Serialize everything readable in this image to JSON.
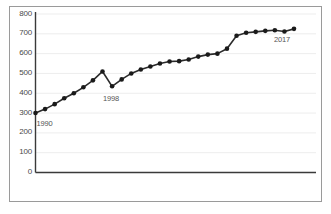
{
  "chart_data": {
    "type": "line",
    "title": "",
    "subtitle": "",
    "xlabel": "",
    "ylabel": "",
    "ylim": [
      0,
      800
    ],
    "xlim": [
      1990,
      2017
    ],
    "grid": true,
    "grid_axis": "y",
    "legend": "none",
    "marker": "filled-circle",
    "line_color": "#2b2b2b",
    "marker_color": "#1a1a1a",
    "grid_color": "#ededed",
    "axis_color": "#3a3a3a",
    "background": "#ffffff",
    "ytick_labels": [
      "800",
      "700",
      "600",
      "500",
      "400",
      "300",
      "200",
      "100",
      "0"
    ],
    "ytick_values": [
      800,
      700,
      600,
      500,
      400,
      300,
      200,
      100,
      0
    ],
    "xtick_labels": [],
    "annotations": [
      {
        "text": "1990",
        "x": 1990,
        "y": 300,
        "position": "below-right"
      },
      {
        "text": "1998",
        "x": 1998,
        "y": 435,
        "position": "below"
      },
      {
        "text": "2017",
        "x": 2017,
        "y": 725,
        "position": "below-left"
      }
    ],
    "x": [
      1990,
      1991,
      1992,
      1993,
      1994,
      1995,
      1996,
      1997,
      1998,
      1999,
      2000,
      2001,
      2002,
      2003,
      2004,
      2005,
      2006,
      2007,
      2008,
      2009,
      2010,
      2011,
      2012,
      2013,
      2014,
      2015,
      2016,
      2017
    ],
    "categories": [
      "1990",
      "1991",
      "1992",
      "1993",
      "1994",
      "1995",
      "1996",
      "1997",
      "1998",
      "1999",
      "2000",
      "2001",
      "2002",
      "2003",
      "2004",
      "2005",
      "2006",
      "2007",
      "2008",
      "2009",
      "2010",
      "2011",
      "2012",
      "2013",
      "2014",
      "2015",
      "2016",
      "2017"
    ],
    "values": [
      300,
      320,
      345,
      375,
      400,
      430,
      465,
      510,
      435,
      470,
      500,
      520,
      535,
      550,
      560,
      562,
      570,
      585,
      595,
      600,
      625,
      690,
      705,
      710,
      715,
      718,
      712,
      725
    ],
    "series": [
      {
        "name": "series-1",
        "values": [
          300,
          320,
          345,
          375,
          400,
          430,
          465,
          510,
          435,
          470,
          500,
          520,
          535,
          550,
          560,
          562,
          570,
          585,
          595,
          600,
          625,
          690,
          705,
          710,
          715,
          718,
          712,
          725
        ]
      }
    ]
  }
}
